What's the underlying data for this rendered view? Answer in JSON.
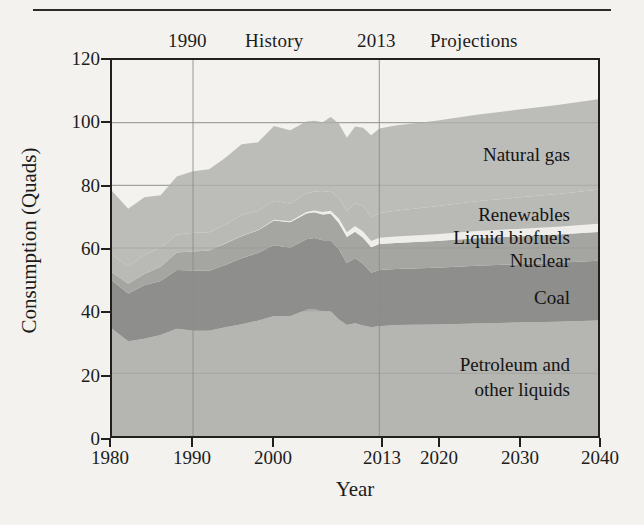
{
  "figure": {
    "ytitle": "Consumption (Quads)",
    "xtitle": "Year",
    "annotations": {
      "history_divider_year": "1990",
      "history": "History",
      "projection_start_year": "2013",
      "projections": "Projections"
    }
  },
  "series_labels": {
    "natural_gas": "Natural gas",
    "renewables": "Renewables",
    "liquid_biofuels": "Liquid biofuels",
    "nuclear": "Nuclear",
    "coal": "Coal",
    "petroleum_line1": "Petroleum and",
    "petroleum_line2": "other liquids"
  },
  "colors": {
    "petroleum": "#b5b5b2",
    "coal": "#8e8e8c",
    "nuclear": "#a5a5a2",
    "liquid_biofuels": "#efeeea",
    "renewables": "#b9b9b6",
    "natural_gas": "#bcbcb9",
    "axis": "#20201f",
    "grid": "#8c8c88",
    "background": "#f3f2ee"
  },
  "chart_data": {
    "type": "area",
    "stacked": true,
    "title": "",
    "xlabel": "Year",
    "ylabel": "Consumption (Quads)",
    "xlim": [
      1980,
      2040
    ],
    "ylim": [
      0,
      120
    ],
    "yticks": [
      0,
      20,
      40,
      60,
      80,
      100,
      120
    ],
    "xticks": [
      1980,
      1990,
      2000,
      2013,
      2020,
      2030,
      2040
    ],
    "grid": true,
    "gridlines_x": [
      1990,
      2013
    ],
    "legend": "in-plot labels",
    "history_range": [
      1980,
      2013
    ],
    "projection_range": [
      2013,
      2040
    ],
    "x": [
      1980,
      1982,
      1984,
      1986,
      1988,
      1990,
      1992,
      1994,
      1996,
      1998,
      2000,
      2002,
      2004,
      2005,
      2006,
      2007,
      2008,
      2009,
      2010,
      2011,
      2012,
      2013,
      2015,
      2020,
      2025,
      2030,
      2035,
      2040
    ],
    "series": [
      {
        "name": "Petroleum and other liquids",
        "color": "#b5b5b2",
        "values": [
          34.2,
          30.2,
          31.0,
          32.2,
          34.2,
          33.6,
          33.6,
          34.7,
          35.7,
          36.8,
          38.3,
          38.2,
          40.3,
          40.4,
          40.0,
          39.8,
          37.2,
          35.4,
          36.0,
          35.3,
          34.7,
          35.0,
          35.4,
          35.6,
          35.9,
          36.2,
          36.5,
          36.9
        ]
      },
      {
        "name": "Coal",
        "color": "#8e8e8c",
        "values": [
          15.4,
          15.3,
          17.1,
          17.3,
          18.8,
          19.2,
          19.1,
          19.9,
          21.0,
          21.6,
          22.6,
          21.9,
          22.5,
          22.8,
          22.5,
          22.7,
          22.4,
          19.7,
          20.8,
          19.7,
          17.4,
          18.0,
          17.9,
          18.1,
          18.4,
          18.6,
          18.8,
          19.0
        ]
      },
      {
        "name": "Nuclear",
        "color": "#a5a5a2",
        "values": [
          2.7,
          3.1,
          3.6,
          4.5,
          5.6,
          6.1,
          6.5,
          6.8,
          7.1,
          7.2,
          7.9,
          8.1,
          8.2,
          8.2,
          8.2,
          8.4,
          8.4,
          8.4,
          8.4,
          8.3,
          8.1,
          8.3,
          8.3,
          8.5,
          8.8,
          8.9,
          9.0,
          9.2
        ]
      },
      {
        "name": "Liquid biofuels",
        "color": "#efeeea",
        "values": [
          0.0,
          0.0,
          0.0,
          0.0,
          0.0,
          0.0,
          0.0,
          0.1,
          0.1,
          0.1,
          0.2,
          0.3,
          0.5,
          0.6,
          0.8,
          1.0,
          1.4,
          1.5,
          1.8,
          2.0,
          2.0,
          2.0,
          2.1,
          2.2,
          2.3,
          2.4,
          2.5,
          2.6
        ]
      },
      {
        "name": "Renewables",
        "color": "#b9b9b6",
        "values": [
          5.5,
          5.5,
          6.1,
          6.1,
          5.6,
          6.0,
          5.8,
          6.0,
          6.6,
          6.1,
          6.1,
          5.6,
          6.0,
          6.0,
          6.4,
          6.3,
          6.5,
          6.8,
          7.2,
          8.1,
          7.6,
          7.9,
          8.2,
          8.9,
          9.5,
          10.0,
          10.4,
          10.9
        ]
      },
      {
        "name": "Natural gas",
        "color": "#bcbcb9",
        "values": [
          20.4,
          18.4,
          18.4,
          16.7,
          18.6,
          19.6,
          20.1,
          21.3,
          22.6,
          21.9,
          23.8,
          23.5,
          22.9,
          22.6,
          22.2,
          23.6,
          23.8,
          23.4,
          24.6,
          25.0,
          26.2,
          26.9,
          27.2,
          27.3,
          27.6,
          28.0,
          28.4,
          28.9
        ]
      }
    ],
    "totals": [
      78.2,
      72.5,
      76.2,
      76.8,
      82.8,
      84.5,
      85.1,
      88.8,
      93.1,
      93.7,
      98.9,
      97.6,
      100.4,
      100.6,
      100.1,
      101.8,
      99.7,
      95.2,
      98.8,
      98.4,
      96.0,
      98.1,
      99.1,
      100.6,
      102.5,
      104.1,
      105.6,
      107.5
    ]
  }
}
